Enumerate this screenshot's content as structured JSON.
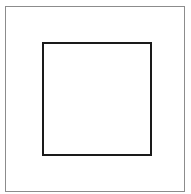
{
  "diagram": {
    "shapes": [
      {
        "id": "outer-square",
        "type": "rectangle",
        "stroke": "#8c8c8c",
        "fill": "#ffffff"
      },
      {
        "id": "inner-square",
        "type": "rectangle",
        "stroke": "#1a1a1a",
        "fill": "#ffffff"
      }
    ]
  }
}
